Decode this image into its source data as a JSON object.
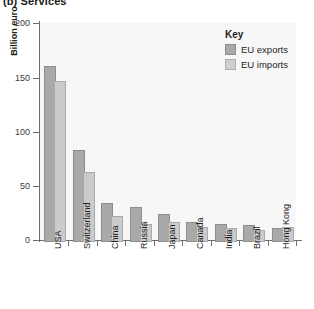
{
  "figure": {
    "title": "(b) Services",
    "ylabel": "Billion euro",
    "legend": {
      "title": "Key",
      "entries": [
        {
          "label": "EU exports",
          "color": "#a9a9a9"
        },
        {
          "label": "EU imports",
          "color": "#cfcfcf"
        }
      ]
    },
    "yticks": [
      "0",
      "50",
      "100",
      "150",
      "200"
    ],
    "colors": {
      "exports": "#a9a9a9",
      "imports": "#cfcfcf",
      "plot_background": "#f7f7f7",
      "axis": "#6d6d6d"
    }
  },
  "chart_data": {
    "type": "bar",
    "title": "(b) Services",
    "xlabel": "",
    "ylabel": "Billion euro",
    "ylim": [
      0,
      200
    ],
    "yticks": [
      0,
      50,
      100,
      150,
      200
    ],
    "grid": false,
    "legend_position": "top-right",
    "legend_title": "Key",
    "categories": [
      "USA",
      "Switzerland",
      "China",
      "Russia",
      "Japan",
      "Canada",
      "India",
      "Brazil",
      "Hong Kong"
    ],
    "series": [
      {
        "name": "EU exports",
        "values": [
          160,
          83,
          34,
          30,
          24,
          17,
          15,
          14,
          11
        ]
      },
      {
        "name": "EU imports",
        "values": [
          147,
          63,
          22,
          15,
          17,
          12,
          11,
          9,
          12
        ]
      }
    ]
  }
}
